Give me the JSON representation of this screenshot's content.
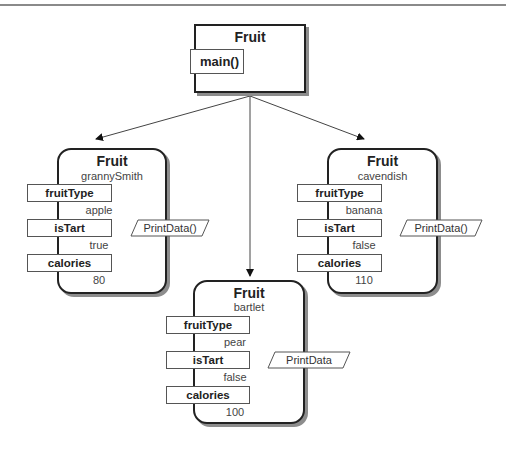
{
  "diagram": {
    "type": "object-instance diagram",
    "class_box": {
      "title": "Fruit",
      "method": "main()"
    },
    "arrows": [
      {
        "from": "class_box",
        "to": "grannySmith"
      },
      {
        "from": "class_box",
        "to": "bartlet"
      },
      {
        "from": "class_box",
        "to": "cavendish"
      }
    ],
    "objects": [
      {
        "class": "Fruit",
        "name": "grannySmith",
        "fields": [
          {
            "label": "fruitType",
            "value": "apple"
          },
          {
            "label": "isTart",
            "value": "true"
          },
          {
            "label": "calories",
            "value": "80"
          }
        ],
        "method": "PrintData()"
      },
      {
        "class": "Fruit",
        "name": "cavendish",
        "fields": [
          {
            "label": "fruitType",
            "value": "banana"
          },
          {
            "label": "isTart",
            "value": "false"
          },
          {
            "label": "calories",
            "value": "110"
          }
        ],
        "method": "PrintData()"
      },
      {
        "class": "Fruit",
        "name": "bartlet",
        "fields": [
          {
            "label": "fruitType",
            "value": "pear"
          },
          {
            "label": "isTart",
            "value": "false"
          },
          {
            "label": "calories",
            "value": "100"
          }
        ],
        "method": "PrintData"
      }
    ]
  }
}
